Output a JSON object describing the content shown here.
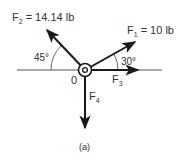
{
  "diagram": {
    "origin_label": "0",
    "forces": [
      {
        "name": "F",
        "sub": "1",
        "value": "= 10 lb",
        "angle_deg": 30,
        "direction": "up-right"
      },
      {
        "name": "F",
        "sub": "2",
        "value": "= 14.14 lb",
        "angle_deg": 45,
        "direction": "up-left"
      },
      {
        "name": "F",
        "sub": "3",
        "value": "",
        "angle_deg": 0,
        "direction": "right"
      },
      {
        "name": "F",
        "sub": "4",
        "value": "",
        "angle_deg": 270,
        "direction": "down"
      }
    ],
    "angle_labels": {
      "f2": "45°",
      "f1": "30°"
    },
    "caption": "(a)",
    "colors": {
      "ink": "#1a1a1a",
      "text": "#333333",
      "background": "#ffffff"
    }
  }
}
